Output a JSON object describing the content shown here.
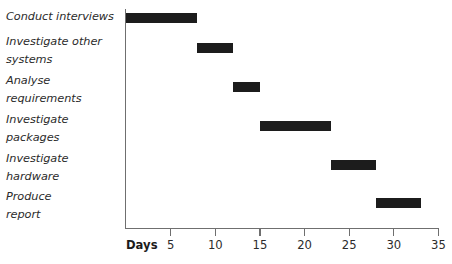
{
  "chart_data": {
    "type": "bar",
    "subtype": "gantt",
    "title": "",
    "xlabel": "Days",
    "ylabel": "",
    "xlim": [
      0,
      35
    ],
    "xticks": [
      5,
      10,
      15,
      20,
      25,
      30,
      35
    ],
    "grid": false,
    "legend": "none",
    "bar_color": "#1c1c1c",
    "axis_color": "#6f6f6f",
    "categories": [
      "Conduct interviews",
      "Investigate other systems",
      "Analyse requirements",
      "Investigate packages",
      "Investigate hardware",
      "Produce report"
    ],
    "tasks": [
      {
        "label": "Conduct interviews",
        "label_lines": "Conduct interviews",
        "start": 0,
        "end": 8,
        "duration": 8
      },
      {
        "label": "Investigate other systems",
        "label_lines": "Investigate other\nsystems",
        "start": 8,
        "end": 12,
        "duration": 4
      },
      {
        "label": "Analyse requirements",
        "label_lines": "Analyse\nrequirements",
        "start": 12,
        "end": 15,
        "duration": 3
      },
      {
        "label": "Investigate packages",
        "label_lines": "Investigate\npackages",
        "start": 15,
        "end": 23,
        "duration": 8
      },
      {
        "label": "Investigate hardware",
        "label_lines": "Investigate\nhardware",
        "start": 23,
        "end": 28,
        "duration": 5
      },
      {
        "label": "Produce report",
        "label_lines": "Produce\nreport",
        "start": 28,
        "end": 33,
        "duration": 5
      }
    ]
  },
  "axis": {
    "title": "Days",
    "tick_labels": [
      "5",
      "10",
      "15",
      "20",
      "25",
      "30",
      "35"
    ]
  },
  "labels": {
    "row0": "Conduct interviews",
    "row1": "Investigate other\nsystems",
    "row2": "Analyse\nrequirements",
    "row3": "Investigate\npackages",
    "row4": "Investigate\nhardware",
    "row5": "Produce\nreport"
  }
}
